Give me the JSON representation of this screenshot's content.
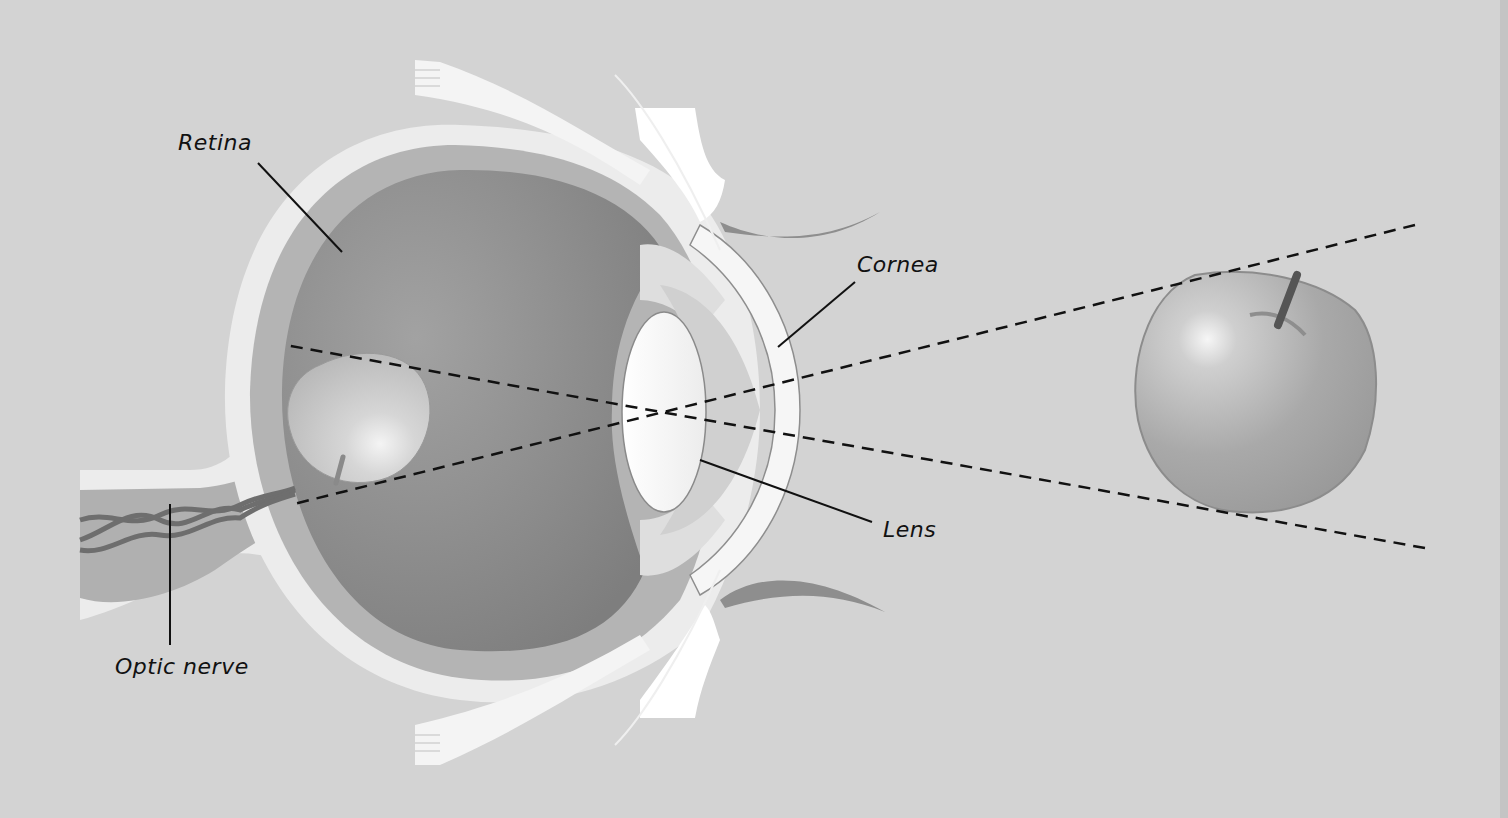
{
  "diagram": {
    "labels": {
      "retina": "Retina",
      "cornea": "Cornea",
      "lens": "Lens",
      "optic_nerve": "Optic nerve"
    },
    "objects": {
      "real_object": "apple (upright)",
      "retinal_image": "apple (inverted)"
    },
    "colors": {
      "background": "#d3d3d3",
      "eye_interior": "#8a8a8a",
      "sclera": "#ececec",
      "choroid": "#b4b4b4",
      "lens": "#f7f7f7",
      "apple": "#a8a8a8",
      "ray_lines": "#111111"
    }
  }
}
